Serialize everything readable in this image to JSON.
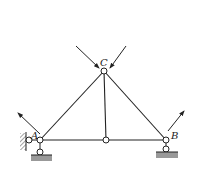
{
  "diagram": {
    "type": "truss",
    "labels": {
      "apex": "C",
      "left_support": "A",
      "right_support": "B"
    },
    "colors": {
      "line": "#222222",
      "ground": "#888888",
      "background": "#ffffff"
    },
    "nodes": [
      {
        "id": "C",
        "x": 104,
        "y": 71
      },
      {
        "id": "A",
        "x": 40,
        "y": 140
      },
      {
        "id": "M",
        "x": 106,
        "y": 140
      },
      {
        "id": "B",
        "x": 166,
        "y": 140
      }
    ],
    "members": [
      [
        "A",
        "C"
      ],
      [
        "C",
        "B"
      ],
      [
        "C",
        "M"
      ],
      [
        "A",
        "M"
      ],
      [
        "M",
        "B"
      ]
    ],
    "forces": [
      {
        "at": "C",
        "direction": "down-right"
      },
      {
        "at": "C",
        "direction": "down-left"
      },
      {
        "at": "A",
        "direction": "up-left"
      },
      {
        "at": "B",
        "direction": "up-right"
      }
    ]
  }
}
